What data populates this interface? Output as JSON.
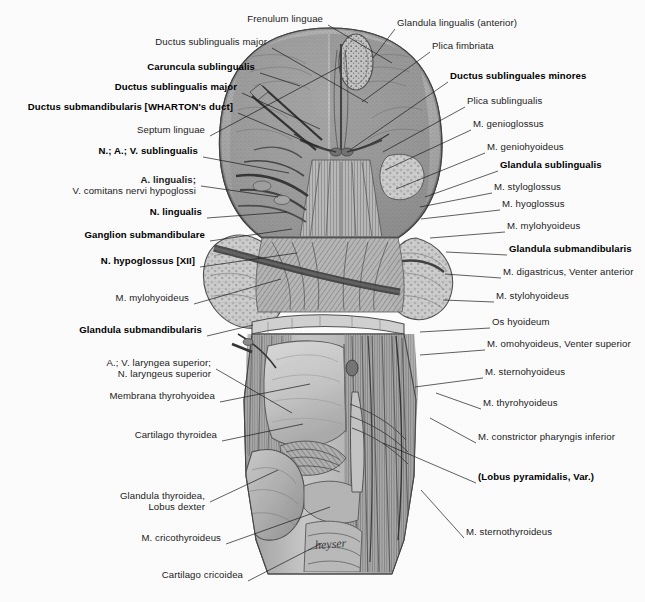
{
  "figure": {
    "name": "anatomical-plate",
    "signature": "heyser",
    "background_color": "#fdfdfd",
    "ink_color": "#1b1b1b",
    "tone_dark": "#4a4a4a",
    "tone_mid": "#8d8d8d",
    "tone_light": "#cfcfcf"
  },
  "labels_left": [
    {
      "id": "frenulum-linguae",
      "text": "Frenulum linguae",
      "bold": false,
      "x": 323,
      "y": 20,
      "leader": [
        [
          328,
          25
        ],
        [
          392,
          63
        ]
      ]
    },
    {
      "id": "ductus-sublingualis-major-plain",
      "text": "Ductus sublingualis major",
      "bold": false,
      "x": 267,
      "y": 43,
      "leader": [
        [
          272,
          48
        ],
        [
          368,
          103
        ]
      ]
    },
    {
      "id": "caruncula-sublingualis",
      "text": "Caruncula sublingualis",
      "bold": true,
      "x": 255,
      "y": 68,
      "leader": [
        [
          260,
          73
        ],
        [
          300,
          86
        ]
      ]
    },
    {
      "id": "ductus-sublingualis-major-bold",
      "text": "Ductus sublingualis major",
      "bold": true,
      "x": 237,
      "y": 88,
      "leader": [
        [
          242,
          93
        ],
        [
          320,
          129
        ]
      ]
    },
    {
      "id": "ductus-submandibularis-wharton",
      "text": "Ductus submandibularis [WHARTON's duct]",
      "bold": true,
      "x": 233,
      "y": 108,
      "leader": [
        [
          238,
          113
        ],
        [
          318,
          147
        ]
      ]
    },
    {
      "id": "septum-linguae",
      "text": "Septum linguae",
      "bold": false,
      "x": 205,
      "y": 131,
      "leader": [
        [
          210,
          136
        ],
        [
          341,
          66
        ]
      ]
    },
    {
      "id": "n-a-v-sublingualis",
      "text": "N.; A.; V. sublingualis",
      "bold": true,
      "x": 198,
      "y": 152,
      "leader": [
        [
          203,
          157
        ],
        [
          289,
          173
        ]
      ]
    },
    {
      "id": "a-lingualis-v-comitans",
      "text": "A. lingualis;\nV. comitans nervi hypoglossi",
      "bold_first_line": true,
      "x": 196,
      "y": 181,
      "leader": [
        [
          201,
          186
        ],
        [
          278,
          197
        ]
      ]
    },
    {
      "id": "n-lingualis",
      "text": "N. lingualis",
      "bold": true,
      "x": 202,
      "y": 213,
      "leader": [
        [
          207,
          218
        ],
        [
          287,
          212
        ]
      ]
    },
    {
      "id": "ganglion-submandibulare",
      "text": "Ganglion submandibulare",
      "bold": true,
      "x": 205,
      "y": 236,
      "leader": [
        [
          210,
          241
        ],
        [
          292,
          229
        ]
      ]
    },
    {
      "id": "n-hypoglossus-xii",
      "text": "N. hypoglossus [XII]",
      "bold": true,
      "x": 195,
      "y": 262,
      "leader": [
        [
          200,
          267
        ],
        [
          297,
          253
        ]
      ]
    },
    {
      "id": "m-mylohyoideus-left",
      "text": "M. mylohyoideus",
      "bold": false,
      "x": 189,
      "y": 299,
      "leader": [
        [
          194,
          304
        ],
        [
          281,
          279
        ]
      ]
    },
    {
      "id": "glandula-submandibularis-left",
      "text": "Glandula submandibularis",
      "bold": true,
      "x": 202,
      "y": 331,
      "leader": [
        [
          207,
          336
        ],
        [
          253,
          325
        ]
      ]
    },
    {
      "id": "a-v-laryngea-n-laryngeus-superior",
      "text": "A.; V. laryngea superior;\nN. laryngeus superior",
      "bold": false,
      "x": 211,
      "y": 364,
      "leader": [
        [
          216,
          369
        ],
        [
          292,
          413
        ]
      ]
    },
    {
      "id": "membrana-thyrohyoidea",
      "text": "Membrana thyrohyoidea",
      "bold": false,
      "x": 215,
      "y": 397,
      "leader": [
        [
          220,
          402
        ],
        [
          310,
          384
        ]
      ]
    },
    {
      "id": "cartilago-thyroidea",
      "text": "Cartilago thyroidea",
      "bold": false,
      "x": 217,
      "y": 436,
      "leader": [
        [
          222,
          441
        ],
        [
          303,
          424
        ]
      ]
    },
    {
      "id": "glandula-thyroidea-lobus-dexter",
      "text": "Glandula thyroidea,\nLobus dexter",
      "bold": false,
      "x": 205,
      "y": 497,
      "leader": [
        [
          210,
          502
        ],
        [
          278,
          470
        ]
      ]
    },
    {
      "id": "m-cricothyroideus",
      "text": "M. cricothyroideus",
      "bold": false,
      "x": 221,
      "y": 539,
      "leader": [
        [
          226,
          544
        ],
        [
          330,
          507
        ]
      ]
    },
    {
      "id": "cartilago-cricoidea",
      "text": "Cartilago cricoidea",
      "bold": false,
      "x": 243,
      "y": 576,
      "leader": [
        [
          248,
          581
        ],
        [
          322,
          543
        ]
      ]
    }
  ],
  "labels_right": [
    {
      "id": "glandula-lingualis-anterior",
      "text": "Glandula lingualis (anterior)",
      "bold": false,
      "x": 397,
      "y": 24,
      "leader": [
        [
          395,
          29
        ],
        [
          373,
          58
        ]
      ]
    },
    {
      "id": "plica-fimbriata",
      "text": "Plica fimbriata",
      "bold": false,
      "x": 432,
      "y": 47,
      "leader": [
        [
          430,
          52
        ],
        [
          362,
          102
        ]
      ]
    },
    {
      "id": "ductus-sublinguales-minores",
      "text": "Ductus sublinguales minores",
      "bold": true,
      "x": 450,
      "y": 77,
      "leader": [
        [
          448,
          82
        ],
        [
          350,
          150
        ]
      ]
    },
    {
      "id": "plica-sublingualis",
      "text": "Plica sublingualis",
      "bold": false,
      "x": 467,
      "y": 102,
      "leader": [
        [
          465,
          107
        ],
        [
          383,
          152
        ]
      ]
    },
    {
      "id": "m-genioglossus",
      "text": "M. genioglossus",
      "bold": false,
      "x": 473,
      "y": 125,
      "leader": [
        [
          471,
          130
        ],
        [
          385,
          170
        ]
      ]
    },
    {
      "id": "m-geniohyoideus",
      "text": "M. geniohyoideus",
      "bold": false,
      "x": 487,
      "y": 148,
      "leader": [
        [
          485,
          153
        ],
        [
          396,
          189
        ]
      ]
    },
    {
      "id": "glandula-sublingualis",
      "text": "Glandula sublingualis",
      "bold": true,
      "x": 500,
      "y": 166,
      "leader": [
        [
          498,
          171
        ],
        [
          425,
          197
        ]
      ]
    },
    {
      "id": "m-styloglossus",
      "text": "M. styloglossus",
      "bold": false,
      "x": 494,
      "y": 188,
      "leader": [
        [
          492,
          193
        ],
        [
          420,
          207
        ]
      ]
    },
    {
      "id": "m-hyoglossus",
      "text": "M. hyoglossus",
      "bold": false,
      "x": 502,
      "y": 205,
      "leader": [
        [
          500,
          210
        ],
        [
          421,
          219
        ]
      ]
    },
    {
      "id": "m-mylohyoideus-right",
      "text": "M. mylohyoideus",
      "bold": false,
      "x": 507,
      "y": 227,
      "leader": [
        [
          505,
          232
        ],
        [
          430,
          238
        ]
      ]
    },
    {
      "id": "glandula-submandibularis-right",
      "text": "Glandula submandibularis",
      "bold": true,
      "x": 509,
      "y": 250,
      "leader": [
        [
          507,
          255
        ],
        [
          446,
          252
        ]
      ]
    },
    {
      "id": "m-digastricus-venter-anterior",
      "text": "M. digastricus, Venter anterior",
      "bold": false,
      "x": 503,
      "y": 273,
      "leader": [
        [
          501,
          278
        ],
        [
          445,
          274
        ]
      ]
    },
    {
      "id": "m-stylohyoideus",
      "text": "M. stylohyoideus",
      "bold": false,
      "x": 496,
      "y": 297,
      "leader": [
        [
          494,
          302
        ],
        [
          443,
          300
        ]
      ]
    },
    {
      "id": "os-hyoideum",
      "text": "Os hyoideum",
      "bold": false,
      "x": 492,
      "y": 323,
      "leader": [
        [
          490,
          328
        ],
        [
          420,
          332
        ]
      ]
    },
    {
      "id": "m-omohyoideus-venter-superior",
      "text": "M. omohyoideus, Venter superior",
      "bold": false,
      "x": 487,
      "y": 345,
      "leader": [
        [
          485,
          350
        ],
        [
          420,
          355
        ]
      ]
    },
    {
      "id": "m-sternohyoideus",
      "text": "M. sternohyoideus",
      "bold": false,
      "x": 485,
      "y": 373,
      "leader": [
        [
          483,
          378
        ],
        [
          415,
          387
        ]
      ]
    },
    {
      "id": "m-thyrohyoideus",
      "text": "M. thyrohyoideus",
      "bold": false,
      "x": 483,
      "y": 404,
      "leader": [
        [
          481,
          409
        ],
        [
          436,
          393
        ]
      ]
    },
    {
      "id": "m-constrictor-pharyngis-inferior",
      "text": "M. constrictor pharyngis inferior",
      "bold": false,
      "x": 478,
      "y": 438,
      "leader": [
        [
          476,
          443
        ],
        [
          430,
          418
        ]
      ]
    },
    {
      "id": "lobus-pyramidalis-var",
      "text": "(Lobus pyramidalis, Var.)",
      "bold": true,
      "x": 478,
      "y": 478,
      "leader": [
        [
          476,
          483
        ],
        [
          383,
          443
        ]
      ]
    },
    {
      "id": "m-sternothyroideus",
      "text": "M. sternothyroideus",
      "bold": false,
      "x": 466,
      "y": 533,
      "leader": [
        [
          464,
          538
        ],
        [
          421,
          490
        ]
      ]
    }
  ]
}
